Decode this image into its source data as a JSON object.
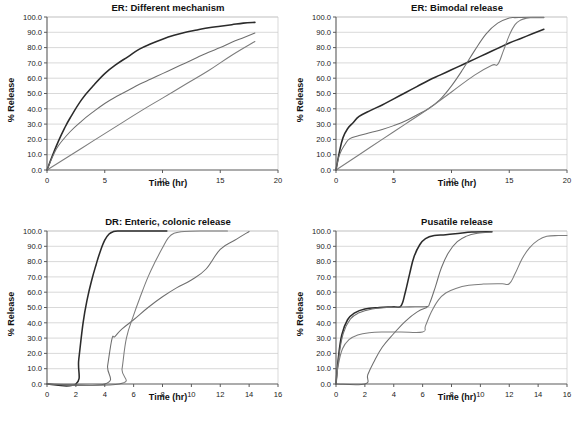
{
  "figure": {
    "caption": "Four drug-release profile panels",
    "background": "#ffffff",
    "series_colors": {
      "dark": "#2b2b2b",
      "mid": "#6e6e6e",
      "light": "#7d7d7d"
    },
    "grid_color": "#c8c8c8",
    "axis_color": "#5a5a5a"
  },
  "chart_data": [
    {
      "id": "er-different-mechanism",
      "type": "line",
      "title": "ER: Different mechanism",
      "xlabel": "Time (hr)",
      "ylabel": "% Release",
      "xlim": [
        0,
        20
      ],
      "ylim": [
        0,
        100
      ],
      "xticks": [
        0,
        5,
        10,
        15,
        20
      ],
      "yticks": [
        0.0,
        10.0,
        20.0,
        30.0,
        40.0,
        50.0,
        60.0,
        70.0,
        80.0,
        90.0,
        100.0
      ],
      "ytick_labels": [
        "0.0",
        "10.0",
        "20.0",
        "30.0",
        "40.0",
        "50.0",
        "60.0",
        "70.0",
        "80.0",
        "90.0",
        "100.0"
      ],
      "xtick_labels": [
        "0",
        "5",
        "10",
        "15",
        "20"
      ],
      "grid": true,
      "legend": "none",
      "series": [
        {
          "name": "First-order / diffusion",
          "color": "dark",
          "x": [
            0,
            0.5,
            1,
            1.5,
            2,
            3,
            4,
            5,
            6,
            7,
            8,
            9,
            10,
            11,
            12,
            13,
            14,
            15,
            16,
            17,
            18
          ],
          "y": [
            0,
            10,
            19,
            27,
            34,
            46,
            55,
            63,
            69,
            74,
            79,
            82.5,
            85.5,
            88,
            90,
            91.5,
            93,
            94,
            95,
            96,
            96.5
          ]
        },
        {
          "name": "Matrix (square-root time)",
          "color": "mid",
          "x": [
            0,
            0.5,
            1,
            2,
            3,
            4,
            5,
            6,
            7,
            8,
            9,
            10,
            11,
            12,
            13,
            14,
            15,
            16,
            17,
            18
          ],
          "y": [
            0,
            9,
            16,
            25,
            32,
            38,
            43.5,
            48,
            52,
            56,
            59.5,
            63,
            66.5,
            70,
            73.5,
            77,
            80,
            83.5,
            86.5,
            89.5
          ]
        },
        {
          "name": "Zero-order",
          "color": "light",
          "x": [
            0,
            2,
            4,
            6,
            8,
            10,
            12,
            14,
            16,
            18
          ],
          "y": [
            0,
            9.5,
            19,
            28.5,
            38,
            47,
            56,
            65,
            75,
            84
          ]
        }
      ]
    },
    {
      "id": "er-bimodal-release",
      "type": "line",
      "title": "ER: Bimodal release",
      "xlabel": "Time (hr)",
      "ylabel": "% Release",
      "xlim": [
        0,
        20
      ],
      "ylim": [
        0,
        100
      ],
      "xticks": [
        0,
        5,
        10,
        15,
        20
      ],
      "yticks": [
        0.0,
        10.0,
        20.0,
        30.0,
        40.0,
        50.0,
        60.0,
        70.0,
        80.0,
        90.0,
        100.0
      ],
      "ytick_labels": [
        "0.0",
        "10.0",
        "20.0",
        "30.0",
        "40.0",
        "50.0",
        "60.0",
        "70.0",
        "80.0",
        "90.0",
        "100.0"
      ],
      "xtick_labels": [
        "0",
        "5",
        "10",
        "15",
        "20"
      ],
      "grid": true,
      "legend": "none",
      "series": [
        {
          "name": "Rapid burst then linear",
          "color": "dark",
          "x": [
            0,
            0.3,
            0.6,
            1,
            1.5,
            2,
            3,
            4,
            5,
            6,
            7,
            8,
            9,
            10,
            11,
            12,
            13,
            14,
            15,
            16,
            17,
            18
          ],
          "y": [
            0,
            12,
            21,
            27,
            31,
            35,
            39,
            42.5,
            46.5,
            50.5,
            54.5,
            58.5,
            62,
            65.5,
            69,
            72.5,
            76,
            79.5,
            83,
            86,
            89,
            92
          ]
        },
        {
          "name": "Bimodal, second pulse at 10 h",
          "color": "mid",
          "x": [
            0,
            0.3,
            0.8,
            1.2,
            2,
            3,
            4,
            5,
            6,
            7,
            8,
            9,
            10,
            11,
            12,
            13,
            14,
            15,
            15.5,
            16,
            17,
            18
          ],
          "y": [
            0,
            10,
            17,
            20.5,
            22.5,
            24.5,
            26.5,
            29,
            32,
            36,
            40,
            46,
            55,
            66,
            78,
            89,
            96,
            99.3,
            99.6,
            99.7,
            99.8,
            99.8
          ]
        },
        {
          "name": "Delayed second pulse at 14 h",
          "color": "light",
          "x": [
            0,
            2,
            4,
            6,
            8,
            10,
            12,
            13.5,
            14,
            14.5,
            15,
            15.5,
            16,
            16.5,
            17,
            18
          ],
          "y": [
            0,
            10,
            20,
            30,
            40,
            51,
            62,
            68.5,
            69,
            78,
            88,
            95,
            98,
            99.2,
            99.5,
            99.6
          ]
        }
      ]
    },
    {
      "id": "dr-enteric-colonic-release",
      "type": "line",
      "title": "DR: Enteric, colonic release",
      "xlabel": "Time (hr)",
      "ylabel": "% Release",
      "xlim": [
        0,
        16
      ],
      "ylim": [
        0,
        100
      ],
      "xticks": [
        0,
        2,
        4,
        6,
        8,
        10,
        12,
        14,
        16
      ],
      "yticks": [
        0.0,
        10.0,
        20.0,
        30.0,
        40.0,
        50.0,
        60.0,
        70.0,
        80.0,
        90.0,
        100.0
      ],
      "ytick_labels": [
        "0.0",
        "10.0",
        "20.0",
        "30.0",
        "40.0",
        "50.0",
        "60.0",
        "70.0",
        "80.0",
        "90.0",
        "100.0"
      ],
      "xtick_labels": [
        "0",
        "2",
        "4",
        "6",
        "8",
        "10",
        "12",
        "14",
        "16"
      ],
      "grid": true,
      "legend": "none",
      "series": [
        {
          "name": "Enteric, 2 h lag",
          "color": "dark",
          "x": [
            0,
            2,
            2.2,
            2.5,
            2.8,
            3.1,
            3.4,
            3.7,
            4.0,
            4.3,
            4.6,
            5.0,
            5.5,
            6.5,
            8.0,
            8.3
          ],
          "y": [
            0,
            0,
            16,
            40,
            56,
            68,
            78,
            87,
            94,
            98,
            99.6,
            100,
            100,
            100,
            100,
            100
          ]
        },
        {
          "name": "Colonic, 4 h lag with plateau",
          "color": "mid",
          "x": [
            0,
            4.0,
            4.2,
            4.5,
            4.7,
            5.2,
            6.0,
            7.0,
            8.0,
            9.0,
            10.0,
            11.0,
            12.0,
            13.0,
            14.0
          ],
          "y": [
            0,
            0,
            12,
            29.5,
            31,
            36,
            42,
            50,
            57,
            63,
            68,
            75,
            88,
            94,
            99.7
          ]
        },
        {
          "name": "Colonic, 5 h lag",
          "color": "light",
          "x": [
            0,
            5.0,
            5.2,
            5.5,
            6.0,
            6.5,
            7.0,
            7.5,
            8.0,
            8.4,
            8.8,
            9.5,
            11.0,
            12.5
          ],
          "y": [
            0,
            0,
            10,
            30,
            45,
            58,
            70,
            80,
            89,
            95.5,
            98.5,
            99.7,
            100,
            100
          ]
        }
      ]
    },
    {
      "id": "pusatile-release",
      "type": "line",
      "title": "Pusatile release",
      "xlabel": "Time (hr)",
      "ylabel": "% Release",
      "xlim": [
        0,
        16
      ],
      "ylim": [
        0,
        100
      ],
      "xticks": [
        0,
        2,
        4,
        6,
        8,
        10,
        12,
        14,
        16
      ],
      "yticks": [
        0.0,
        10.0,
        20.0,
        30.0,
        40.0,
        50.0,
        60.0,
        70.0,
        80.0,
        90.0,
        100.0
      ],
      "ytick_labels": [
        "0.0",
        "10.0",
        "20.0",
        "30.0",
        "40.0",
        "50.0",
        "60.0",
        "70.0",
        "80.0",
        "90.0",
        "100.0"
      ],
      "xtick_labels": [
        "0",
        "2",
        "4",
        "6",
        "8",
        "10",
        "12",
        "14",
        "16"
      ],
      "grid": true,
      "legend": "none",
      "series": [
        {
          "name": "Pulse 1 at 0 h, pulse 2 at 4.5 h",
          "color": "dark",
          "x": [
            0,
            0.15,
            0.4,
            0.8,
            1.3,
            2.0,
            3.0,
            4.0,
            4.5,
            4.8,
            5.1,
            5.4,
            5.8,
            6.2,
            6.8,
            7.6,
            8.6,
            9.4,
            10.8
          ],
          "y": [
            0,
            16,
            32,
            42,
            46.5,
            49,
            50,
            50.5,
            51,
            60,
            72,
            83,
            91,
            95,
            97,
            97.5,
            98.5,
            99.3,
            99.5
          ]
        },
        {
          "name": "Pulse 1 at 0 h, pulse 2 at 6.5 h",
          "color": "mid",
          "x": [
            0,
            0.2,
            0.5,
            1.0,
            1.6,
            2.5,
            3.5,
            4.5,
            5.5,
            6.3,
            6.5,
            6.9,
            7.3,
            7.8,
            8.4,
            9.0,
            9.8,
            10.8
          ],
          "y": [
            0,
            18,
            33,
            42.5,
            46.5,
            49,
            50,
            50.3,
            50.5,
            50.7,
            53,
            64,
            76,
            86,
            93,
            96.5,
            98.5,
            99.3
          ]
        },
        {
          "name": "Delayed pulse at 2 h, pulse 2 at 12 h",
          "color": "light",
          "x": [
            0,
            0.15,
            0.45,
            0.9,
            1.5,
            2.3,
            3.3,
            4.5,
            6.0,
            6.2,
            6.6,
            7.1,
            7.6,
            8.3,
            9.2,
            10.2,
            11.5,
            12.0,
            12.4,
            12.9,
            13.4,
            14.0,
            14.6,
            15.4,
            16.0
          ],
          "y": [
            0,
            12,
            23,
            29,
            32,
            33.5,
            34,
            34,
            34,
            38,
            47,
            55,
            59.5,
            62.5,
            64.5,
            65.3,
            65.5,
            65.5,
            72,
            82,
            89,
            94,
            96.5,
            97,
            97
          ]
        },
        {
          "name": "Zero baseline start at 2 h",
          "color": "mid",
          "x": [
            0,
            2.0,
            2.2,
            2.6,
            3.2,
            4.0,
            4.8,
            5.6,
            6.3
          ],
          "y": [
            0,
            0,
            6,
            14,
            24,
            33,
            41,
            47,
            50
          ]
        }
      ]
    }
  ]
}
